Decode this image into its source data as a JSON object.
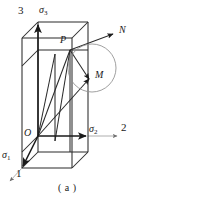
{
  "figure": {
    "caption": "( a )",
    "type": "stress-space-3d-diagram",
    "colors": {
      "ink": "#1a1a1a",
      "thin_line": "#8a8a8a",
      "background": "#ffffff"
    },
    "axes": [
      {
        "name": "axis-1",
        "number_label": "1",
        "stress_label": "σ",
        "stress_subscript": "1",
        "direction": "down-left",
        "number_pos": {
          "x": 16,
          "y": 170
        },
        "stress_pos": {
          "x": 3,
          "y": 151
        }
      },
      {
        "name": "axis-2",
        "number_label": "2",
        "stress_label": "σ",
        "stress_subscript": "2",
        "direction": "right",
        "number_pos": {
          "x": 121,
          "y": 123
        },
        "stress_pos": {
          "x": 88,
          "y": 125
        }
      },
      {
        "name": "axis-3",
        "number_label": "3",
        "stress_label": "σ",
        "stress_subscript": "3",
        "direction": "up",
        "number_pos": {
          "x": 18,
          "y": 7
        },
        "stress_pos": {
          "x": 38,
          "y": 6
        }
      }
    ],
    "points": [
      {
        "name": "origin",
        "label": "O",
        "x": 38,
        "y": 136,
        "label_x": 24,
        "label_y": 129
      },
      {
        "name": "point-P",
        "label": "P",
        "x": 70,
        "y": 50,
        "label_x": 59,
        "label_y": 36
      },
      {
        "name": "point-M",
        "label": "M",
        "x": 89,
        "y": 79,
        "label_x": 94,
        "label_y": 70
      },
      {
        "name": "normal-N",
        "label": "N",
        "x": 114,
        "y": 33,
        "label_x": 119,
        "label_y": 26
      }
    ],
    "circle": {
      "name": "deviatoric-circle",
      "cx": 92,
      "cy": 68,
      "r": 24
    }
  }
}
